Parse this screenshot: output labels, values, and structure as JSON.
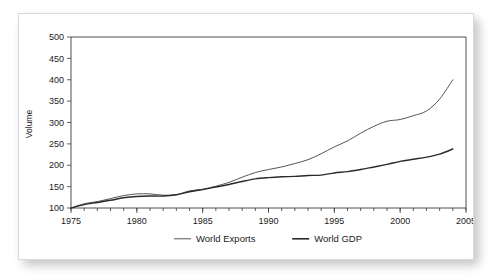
{
  "card": {
    "background_color": "#ffffff",
    "border_color": "#d9d9d9"
  },
  "chart_data": {
    "type": "line",
    "title": "",
    "subtitle": "",
    "xlabel": "",
    "ylabel": "Volume",
    "xlim": [
      1975,
      2005
    ],
    "ylim": [
      100,
      500
    ],
    "ytick_labels": [
      "100",
      "150",
      "200",
      "250",
      "300",
      "350",
      "400",
      "450",
      "500"
    ],
    "ytick_values": [
      100,
      150,
      200,
      250,
      300,
      350,
      400,
      450,
      500
    ],
    "xtick_labels": [
      "1975",
      "1980",
      "1985",
      "1990",
      "1995",
      "2000",
      "2005"
    ],
    "xtick_values": [
      1975,
      1980,
      1985,
      1990,
      1995,
      2000,
      2005
    ],
    "x_minor_tick_step": 1,
    "grid": false,
    "legend_position": "bottom",
    "x": [
      1975,
      1976,
      1977,
      1978,
      1979,
      1980,
      1981,
      1982,
      1983,
      1984,
      1985,
      1986,
      1987,
      1988,
      1989,
      1990,
      1991,
      1992,
      1993,
      1994,
      1995,
      1996,
      1997,
      1998,
      1999,
      2000,
      2001,
      2002,
      2003,
      2004
    ],
    "series": [
      {
        "name": "World Exports",
        "color": "#555555",
        "stroke_width": 1.0,
        "values": [
          100,
          110,
          115,
          122,
          129,
          133,
          133,
          130,
          131,
          140,
          144,
          151,
          160,
          172,
          183,
          190,
          196,
          204,
          213,
          227,
          243,
          257,
          275,
          291,
          303,
          307,
          316,
          327,
          355,
          400
        ]
      },
      {
        "name": "World GDP",
        "color": "#2b2b2b",
        "stroke_width": 1.4,
        "values": [
          100,
          108,
          113,
          118,
          124,
          127,
          128,
          128,
          131,
          138,
          143,
          149,
          155,
          162,
          168,
          171,
          173,
          174,
          176,
          177,
          182,
          185,
          190,
          196,
          202,
          209,
          214,
          219,
          226,
          238
        ]
      }
    ],
    "series_endpoints": {
      "World Exports": 455,
      "World GDP": 245
    }
  },
  "legend": {
    "items": [
      {
        "label": "World Exports",
        "color": "#555555",
        "stroke_width": 1.0
      },
      {
        "label": "World GDP",
        "color": "#2b2b2b",
        "stroke_width": 1.6
      }
    ]
  }
}
